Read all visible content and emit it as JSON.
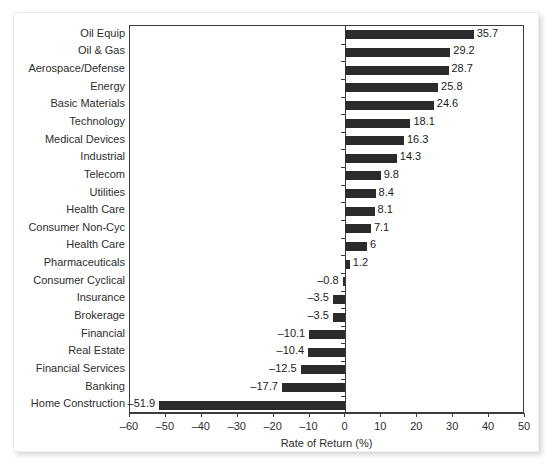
{
  "chart_data": {
    "type": "bar",
    "orientation": "horizontal",
    "title": "",
    "xlabel": "Rate of Return (%)",
    "ylabel": "",
    "xlim": [
      -60,
      50
    ],
    "xticks": [
      -60,
      -50,
      -40,
      -30,
      -20,
      -10,
      0,
      10,
      20,
      30,
      40,
      50
    ],
    "xtick_labels": [
      "–60",
      "–50",
      "–40",
      "–30",
      "–20",
      "–10",
      "0",
      "10",
      "20",
      "30",
      "40",
      "50"
    ],
    "grid": false,
    "legend": null,
    "bar_color": "#2b2b2b",
    "categories": [
      "Oil Equip",
      "Oil & Gas",
      "Aerospace/Defense",
      "Energy",
      "Basic Materials",
      "Technology",
      "Medical Devices",
      "Industrial",
      "Telecom",
      "Utilities",
      "Health Care",
      "Consumer Non-Cyc",
      "Health Care",
      "Pharmaceuticals",
      "Consumer Cyclical",
      "Insurance",
      "Brokerage",
      "Financial",
      "Real Estate",
      "Financial Services",
      "Banking",
      "Home Construction"
    ],
    "values": [
      35.7,
      29.2,
      28.7,
      25.8,
      24.6,
      18.1,
      16.3,
      14.3,
      9.8,
      8.4,
      8.1,
      7.1,
      6,
      1.2,
      -0.8,
      -3.5,
      -3.5,
      -10.1,
      -10.4,
      -12.5,
      -17.7,
      -51.9
    ],
    "value_labels": [
      "35.7",
      "29.2",
      "28.7",
      "25.8",
      "24.6",
      "18.1",
      "16.3",
      "14.3",
      "9.8",
      "8.4",
      "8.1",
      "7.1",
      "6",
      "1.2",
      "–0.8",
      "–3.5",
      "–3.5",
      "–10.1",
      "–10.4",
      "–12.5",
      "–17.7",
      "–51.9"
    ]
  }
}
